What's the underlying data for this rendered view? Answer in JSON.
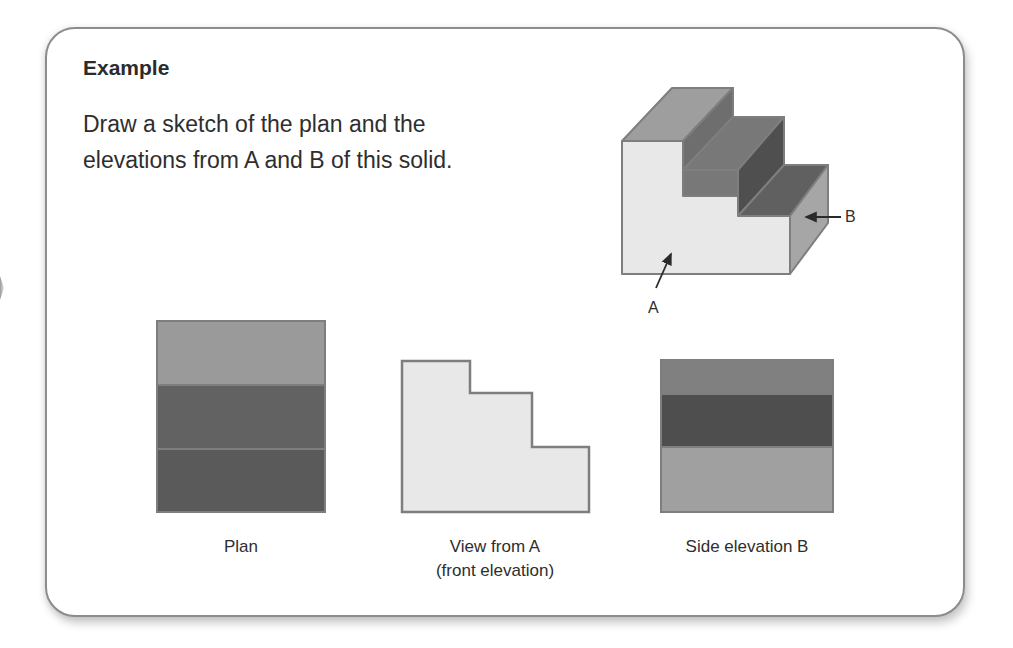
{
  "card": {
    "title": "Example",
    "prompt_line1": "Draw a sketch of the plan and the",
    "prompt_line2": "elevations from A and B of this solid."
  },
  "solid": {
    "label_a": "A",
    "label_b": "B"
  },
  "views": [
    {
      "id": "plan",
      "caption_line1": "Plan",
      "caption_line2": ""
    },
    {
      "id": "front",
      "caption_line1": "View from A",
      "caption_line2": "(front elevation)"
    },
    {
      "id": "side",
      "caption_line1": "Side elevation B",
      "caption_line2": ""
    }
  ],
  "colors": {
    "light_face": "#e8e8e8",
    "top_tread_light": "#9e9e9e",
    "mid_gray": "#7a7a7a",
    "dark_gray": "#5e5e5e",
    "darkest": "#4c4c4c",
    "side_face": "#a6a6a6",
    "outline": "#7e7e7e"
  }
}
